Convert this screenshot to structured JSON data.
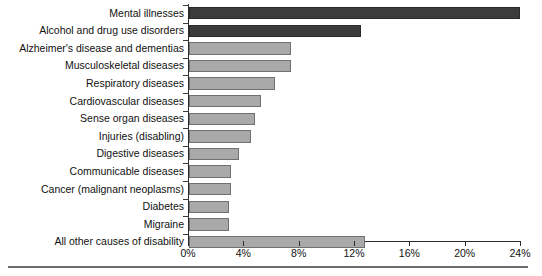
{
  "chart_data": {
    "type": "bar",
    "orientation": "horizontal",
    "title": "",
    "subtitle": "",
    "xlabel": "",
    "ylabel": "",
    "xlim": [
      0,
      24
    ],
    "grid": false,
    "legend": null,
    "colors": {
      "highlight_bar": "#3c3c3c",
      "default_bar": "#a9a9a9",
      "bar_outline": "#6f6f6f",
      "axis": "#2b2b2b",
      "text": "#111111",
      "rule": "#6b6b6b"
    },
    "highlighted_categories": [
      "Mental illnesses",
      "Alcohol and drug use disorders"
    ],
    "xticks": [
      {
        "value": 0,
        "label": "0%"
      },
      {
        "value": 4,
        "label": "4%"
      },
      {
        "value": 8,
        "label": "8%"
      },
      {
        "value": 12,
        "label": "12%"
      },
      {
        "value": 16,
        "label": "16%"
      },
      {
        "value": 20,
        "label": "20%"
      },
      {
        "value": 24,
        "label": "24%"
      }
    ],
    "categories": [
      "Mental illnesses",
      "Alcohol and drug use disorders",
      "Alzheimer's disease and dementias",
      "Musculoskeletal diseases",
      "Respiratory diseases",
      "Cardiovascular diseases",
      "Sense organ diseases",
      "Injuries (disabling)",
      "Digestive diseases",
      "Communicable diseases",
      "Cancer (malignant neoplasms)",
      "Diabetes",
      "Migraine",
      "All other causes of disability"
    ],
    "values": [
      23.9,
      12.4,
      7.4,
      7.4,
      6.2,
      5.2,
      4.8,
      4.5,
      3.6,
      3.0,
      3.0,
      2.9,
      2.9,
      12.7
    ],
    "bars": [
      {
        "label": "Mental illnesses",
        "value": 23.9,
        "highlight": true
      },
      {
        "label": "Alcohol and drug use disorders",
        "value": 12.4,
        "highlight": true
      },
      {
        "label": "Alzheimer's disease and dementias",
        "value": 7.4,
        "highlight": false
      },
      {
        "label": "Musculoskeletal diseases",
        "value": 7.4,
        "highlight": false
      },
      {
        "label": "Respiratory diseases",
        "value": 6.2,
        "highlight": false
      },
      {
        "label": "Cardiovascular diseases",
        "value": 5.2,
        "highlight": false
      },
      {
        "label": "Sense organ diseases",
        "value": 4.8,
        "highlight": false
      },
      {
        "label": "Injuries (disabling)",
        "value": 4.5,
        "highlight": false
      },
      {
        "label": "Digestive diseases",
        "value": 3.6,
        "highlight": false
      },
      {
        "label": "Communicable diseases",
        "value": 3.0,
        "highlight": false
      },
      {
        "label": "Cancer (malignant neoplasms)",
        "value": 3.0,
        "highlight": false
      },
      {
        "label": "Diabetes",
        "value": 2.9,
        "highlight": false
      },
      {
        "label": "Migraine",
        "value": 2.9,
        "highlight": false
      },
      {
        "label": "All other causes of disability",
        "value": 12.7,
        "highlight": false
      }
    ]
  }
}
